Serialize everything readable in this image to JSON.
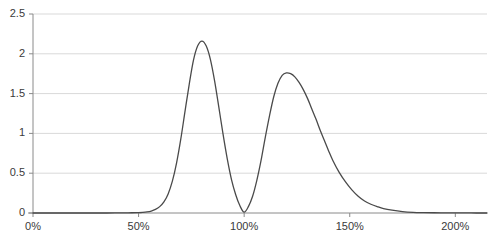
{
  "chart_data": {
    "type": "line",
    "title": "",
    "subtitle": "",
    "xlabel": "",
    "ylabel": "",
    "xlim": [
      0,
      215
    ],
    "ylim": [
      0,
      2.5
    ],
    "grid": true,
    "grid_axis": "y",
    "legend": "none",
    "line_color": "#4a4a4a",
    "grid_color": "#d9d9d9",
    "axis_color": "#8a8a8a",
    "background": "#ffffff",
    "x_unit": "%",
    "x_ticks": [
      0,
      50,
      100,
      150,
      200
    ],
    "x_tick_labels": [
      "0%",
      "50%",
      "100%",
      "150%",
      "200%"
    ],
    "y_ticks": [
      0,
      0.5,
      1,
      1.5,
      2,
      2.5
    ],
    "y_tick_labels": [
      "0",
      "0.5",
      "1",
      "1.5",
      "2",
      "2.5"
    ],
    "annotations": [],
    "peaks": [
      {
        "x": 80,
        "y": 2.16
      },
      {
        "x": 122,
        "y": 1.75
      }
    ],
    "valleys": [
      {
        "x": 100,
        "y": 0.01
      }
    ],
    "x": [
      0,
      5,
      10,
      15,
      20,
      25,
      30,
      35,
      40,
      45,
      50,
      52,
      54,
      56,
      58,
      60,
      62,
      64,
      66,
      68,
      70,
      72,
      74,
      76,
      78,
      80,
      82,
      84,
      86,
      88,
      90,
      92,
      94,
      96,
      98,
      100,
      102,
      104,
      106,
      108,
      110,
      112,
      114,
      116,
      118,
      120,
      122,
      124,
      126,
      128,
      130,
      132,
      134,
      136,
      138,
      140,
      142,
      145,
      148,
      151,
      154,
      157,
      160,
      163,
      166,
      170,
      175,
      180,
      185,
      190,
      195,
      200,
      205,
      210,
      215
    ],
    "values": [
      0,
      0,
      0,
      0,
      0,
      0,
      0,
      0,
      0.001,
      0.002,
      0.005,
      0.008,
      0.014,
      0.025,
      0.045,
      0.08,
      0.14,
      0.24,
      0.4,
      0.63,
      0.93,
      1.28,
      1.62,
      1.92,
      2.1,
      2.16,
      2.1,
      1.93,
      1.66,
      1.33,
      0.99,
      0.68,
      0.42,
      0.23,
      0.09,
      0.01,
      0.08,
      0.21,
      0.41,
      0.66,
      0.95,
      1.22,
      1.46,
      1.63,
      1.73,
      1.76,
      1.75,
      1.71,
      1.64,
      1.55,
      1.44,
      1.31,
      1.18,
      1.04,
      0.91,
      0.78,
      0.66,
      0.51,
      0.39,
      0.29,
      0.21,
      0.15,
      0.11,
      0.08,
      0.055,
      0.035,
      0.018,
      0.009,
      0.005,
      0.003,
      0.002,
      0.001,
      0.001,
      0,
      0
    ]
  },
  "axes": {
    "y_axis_name": "value-axis",
    "x_axis_name": "percent-axis"
  }
}
